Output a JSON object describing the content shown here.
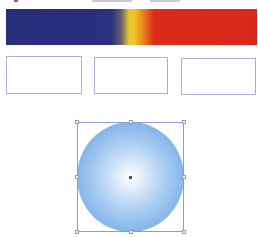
{
  "canvas": {
    "width": 258,
    "height": 237,
    "background": "#ffffff"
  },
  "header_sliver": {
    "note_text": ""
  },
  "gradient_bar": {
    "type": "linear",
    "direction": "to right",
    "stops": [
      {
        "color": "#27307d",
        "position": 0
      },
      {
        "color": "#2a2f80",
        "position": 42
      },
      {
        "color": "#6a6468",
        "position": 46
      },
      {
        "color": "#e7c631",
        "position": 49
      },
      {
        "color": "#f0c82a",
        "position": 51
      },
      {
        "color": "#ea7a1c",
        "position": 55
      },
      {
        "color": "#dc2b1b",
        "position": 59
      },
      {
        "color": "#d9271c",
        "position": 100
      }
    ]
  },
  "swatches": [
    {
      "x": 6,
      "y": 56,
      "w": 76,
      "h": 38,
      "fill": "#ffffff",
      "stroke": "#a7b1d6"
    },
    {
      "x": 94,
      "y": 57,
      "w": 74,
      "h": 37,
      "fill": "#ffffff",
      "stroke": "#a7b1d6"
    },
    {
      "x": 181,
      "y": 58,
      "w": 75,
      "h": 37,
      "fill": "#ffffff",
      "stroke": "#a7b1d6"
    }
  ],
  "circle": {
    "fill_type": "radial",
    "center_color": "#ffffff",
    "mid_color": "#a9cdf2",
    "edge_color": "#5d9ae2",
    "selected": true,
    "bounding_box": {
      "x": 77,
      "y": 122,
      "w": 107,
      "h": 110
    },
    "handle_color": "#8f9bd0"
  }
}
